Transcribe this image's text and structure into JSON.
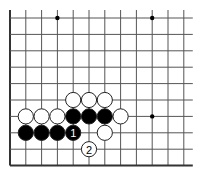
{
  "board": {
    "description": "Go board partial diagram (lower-left corner region)",
    "columns": 12,
    "rows": 10,
    "origin_x": 10,
    "origin_y": 18,
    "spacing_x": 15.8,
    "spacing_y": 16.4,
    "top_open": true,
    "right_open": true,
    "left_edge": true,
    "bottom_edge": true,
    "line_color": "#555555",
    "edge_color": "#333333",
    "star_points": [
      {
        "col": 3,
        "row": 0
      },
      {
        "col": 9,
        "row": 0
      },
      {
        "col": 9,
        "row": 6
      }
    ]
  },
  "stones": [
    {
      "color": "white",
      "col": 4,
      "row": 5
    },
    {
      "color": "white",
      "col": 5,
      "row": 5
    },
    {
      "color": "white",
      "col": 6,
      "row": 5
    },
    {
      "color": "white",
      "col": 1,
      "row": 6
    },
    {
      "color": "white",
      "col": 2,
      "row": 6
    },
    {
      "color": "white",
      "col": 3,
      "row": 6
    },
    {
      "color": "black",
      "col": 4,
      "row": 6
    },
    {
      "color": "black",
      "col": 5,
      "row": 6
    },
    {
      "color": "black",
      "col": 6,
      "row": 6
    },
    {
      "color": "white",
      "col": 7,
      "row": 6
    },
    {
      "color": "black",
      "col": 1,
      "row": 7
    },
    {
      "color": "black",
      "col": 2,
      "row": 7
    },
    {
      "color": "black",
      "col": 3,
      "row": 7
    },
    {
      "color": "black",
      "col": 4,
      "row": 7,
      "label": "1"
    },
    {
      "color": "white",
      "col": 6,
      "row": 7
    },
    {
      "color": "white",
      "col": 5,
      "row": 8,
      "label": "2"
    }
  ],
  "moves": [
    {
      "number": "1",
      "color": "black",
      "col": 4,
      "row": 7
    },
    {
      "number": "2",
      "color": "white",
      "col": 5,
      "row": 8
    }
  ],
  "colors": {
    "black_stone": "#000000",
    "white_stone": "#ffffff",
    "stone_outline": "#222222",
    "background": "#ffffff"
  }
}
